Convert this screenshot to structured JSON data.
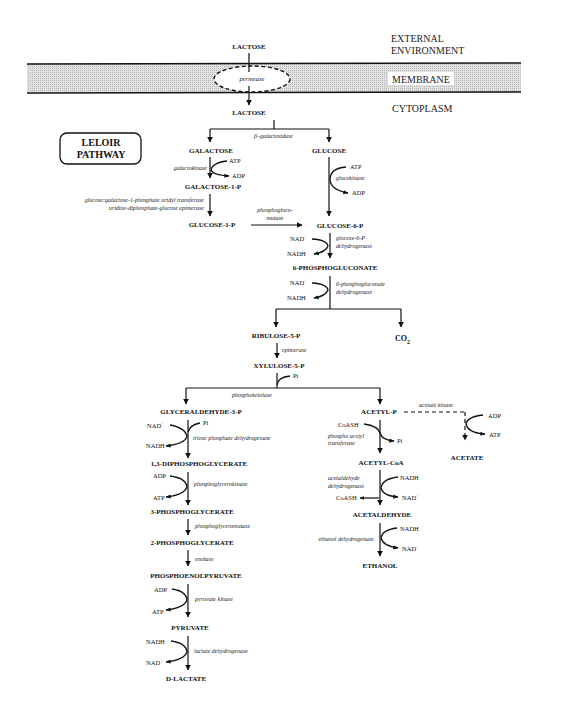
{
  "zones": {
    "external": [
      "EXTERNAL",
      "ENVIRONMENT"
    ],
    "membrane": "MEMBRANE",
    "cytoplasm": "CYTOPLASM"
  },
  "transport": {
    "lactose_out": "LACTOSE",
    "permease": "permease",
    "lactose_in": "LACTOSE"
  },
  "leloir_box": [
    "LELOIR",
    "PATHWAY"
  ],
  "lactose_split": {
    "enzyme": "β–galactosidase",
    "galactose": "GALACTOSE",
    "glucose": "GLUCOSE"
  },
  "leloir": {
    "galactokinase": "galactokinase",
    "atp": "ATP",
    "adp": "ADP",
    "galactose_1p": "GALACTOSE-1-P",
    "enzyme1": "glucose:galactose-1-phosphate uridyl transferase",
    "enzyme2": "uridine-diphosphate-glucose epimerase",
    "glucose_1p": "GLUCOSE-1-P",
    "mutase1": "phosphogluco-",
    "mutase2": "mutase"
  },
  "glucose_branch": {
    "atp": "ATP",
    "glucokinase": "glucokinase",
    "adp": "ADP",
    "glucose_6p": "GLUCOSE-6-P"
  },
  "pentose": {
    "nad1": "NAD",
    "nadh1": "NADH",
    "g6pdh1": "glucose-6-P",
    "g6pdh2": "dehydrogenase",
    "pg6": "6-PHOSPHOGLUCONATE",
    "nad2": "NAD",
    "nadh2": "NADH",
    "pgdh1": "6-phosphogluconate",
    "pgdh2": "dehydrogenase",
    "ribulose": "RIBULOSE-5-P",
    "co2": "CO",
    "co2_sub": "2",
    "epimerase": "epimerase",
    "xylulose": "XYLULOSE-5-P",
    "pi": "Pi",
    "phosphoketolase": "phosphoketolase"
  },
  "glycolysis": {
    "g3p": "GLYCERALDEHYDE-3-P",
    "nad": "NAD",
    "pi": "Pi",
    "nadh": "NADH",
    "tpdh": "triose phosphate dehydrogenase",
    "dpg13": "1,3-DIPHOSPHOGLYCERATE",
    "adp1": "ADP",
    "atp1": "ATP",
    "pgk": "phosphoglycerokinase",
    "pg3": "3-PHOSPHOGLYCERATE",
    "pgm": "phosphoglyceromutase",
    "pg2": "2-PHOSPHOGLYCERATE",
    "enolase": "enolase",
    "pep": "PHOSPHOENOLPYRUVATE",
    "adp2": "ADP",
    "atp2": "ATP",
    "pk": "pyruvate kinase",
    "pyruvate": "PYRUVATE",
    "nadh2": "NADH",
    "nad2": "NAD",
    "ldh": "lactate dehydrogenase",
    "lactate": "D-LACTATE"
  },
  "acetyl_branch": {
    "acetyl_p": "ACETYL-P",
    "acetate_kinase": "acetate kinase",
    "adp": "ADP",
    "atp": "ATP",
    "acetate": "ACETATE",
    "coash1": "CoASH",
    "pta1": "phospho acetyl",
    "pta2": "transferase",
    "pi": "Pi",
    "acetyl_coa": "ACETYL-CoA",
    "adh1": "acetaldehyde",
    "adh2": "dehydrogenase",
    "nadh1": "NADH",
    "nad1": "NAD",
    "coash2": "CoASH",
    "acetaldehyde": "ACETALDEHYDE",
    "edh": "ethanol dehydrogenase",
    "nadh2": "NADH",
    "nad2": "NAD",
    "ethanol": "ETHANOL"
  },
  "superscript_plus": "+"
}
